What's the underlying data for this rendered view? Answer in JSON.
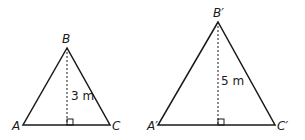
{
  "triangles": [
    {
      "name": "triangle-abc",
      "vertices": {
        "A": "A",
        "B": "B",
        "C": "C"
      },
      "height_label": "3 m"
    },
    {
      "name": "triangle-a-prime-b-prime-c-prime",
      "vertices": {
        "A": "A′",
        "B": "B′",
        "C": "C′"
      },
      "height_label": "5 m"
    }
  ]
}
